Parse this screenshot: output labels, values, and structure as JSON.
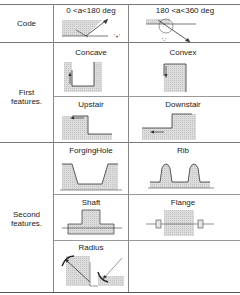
{
  "rows": {
    "code": {
      "label": "Code",
      "left": {
        "title": "0 <a<180 deg",
        "sign": "'+'"
      },
      "right": {
        "title": "180 <a<360 deg",
        "sign": "'-'"
      }
    },
    "first": {
      "label_line1": "First",
      "label_line2": "features.",
      "cells": [
        {
          "title": "Concave"
        },
        {
          "title": "Convex"
        },
        {
          "title": "Upstair"
        },
        {
          "title": "Downstair"
        }
      ]
    },
    "second": {
      "label_line1": "Second",
      "label_line2": "features.",
      "cells": [
        {
          "title": "ForgingHole"
        },
        {
          "title": "Rib"
        },
        {
          "title": "Shaft"
        },
        {
          "title": "Flange"
        },
        {
          "title": "Radius"
        }
      ]
    }
  },
  "colors": {
    "hatch": "#d4d4d4",
    "line": "#333333",
    "grid": "#808080"
  }
}
